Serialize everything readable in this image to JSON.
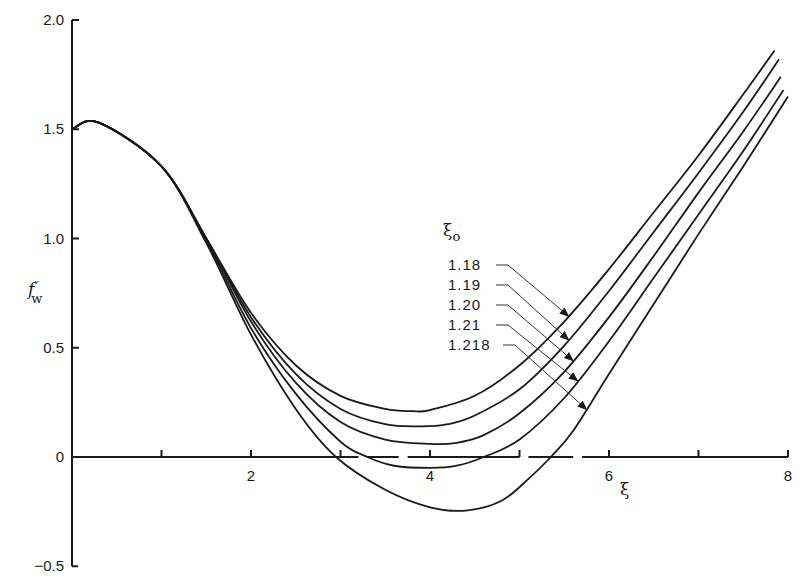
{
  "chart_data": {
    "type": "line",
    "title": "",
    "xlabel": "ξ",
    "ylabel": "f''_w",
    "xlim": [
      0,
      8
    ],
    "ylim": [
      -0.5,
      2.0
    ],
    "x_ticks": [
      2,
      4,
      6,
      8
    ],
    "x_minor_ticks": [
      1,
      3,
      5,
      7
    ],
    "y_ticks": [
      -0.5,
      0,
      0.5,
      1.0,
      1.5,
      2.0
    ],
    "y_tick_labels": [
      "−0.5",
      "0",
      "0.5",
      "1.0",
      "1.5",
      "2.0"
    ],
    "x_tick_labels": [
      "2",
      "4",
      "6",
      "8"
    ],
    "grid": false,
    "legend": {
      "title": "ξ",
      "title_subscript": "o",
      "position": "inside, center-right, with leader arrows to curves",
      "entries": [
        "1.18",
        "1.19",
        "1.20",
        "1.21",
        "1.218"
      ]
    },
    "series": [
      {
        "name": "1.18",
        "x": [
          0,
          0.3,
          1.0,
          1.5,
          2.0,
          2.5,
          3.0,
          3.5,
          3.8,
          4.0,
          4.5,
          5.0,
          5.5,
          6.0,
          6.5,
          7.0,
          7.5,
          7.85
        ],
        "y": [
          1.5,
          1.53,
          1.33,
          1.0,
          0.66,
          0.42,
          0.28,
          0.22,
          0.21,
          0.215,
          0.28,
          0.42,
          0.62,
          0.86,
          1.12,
          1.38,
          1.66,
          1.86
        ]
      },
      {
        "name": "1.19",
        "x": [
          0,
          0.3,
          1.0,
          1.5,
          2.0,
          2.5,
          3.0,
          3.5,
          3.9,
          4.2,
          4.5,
          5.0,
          5.5,
          6.0,
          6.5,
          7.0,
          7.5,
          7.9
        ],
        "y": [
          1.5,
          1.53,
          1.33,
          1.0,
          0.64,
          0.38,
          0.22,
          0.15,
          0.14,
          0.15,
          0.19,
          0.31,
          0.51,
          0.76,
          1.03,
          1.3,
          1.58,
          1.82
        ]
      },
      {
        "name": "1.20",
        "x": [
          0,
          0.3,
          1.0,
          1.5,
          2.0,
          2.5,
          3.0,
          3.5,
          4.0,
          4.3,
          4.6,
          5.0,
          5.5,
          6.0,
          6.5,
          7.0,
          7.5,
          7.92
        ],
        "y": [
          1.5,
          1.53,
          1.33,
          1.0,
          0.62,
          0.34,
          0.16,
          0.08,
          0.06,
          0.065,
          0.1,
          0.2,
          0.39,
          0.64,
          0.92,
          1.21,
          1.49,
          1.74
        ]
      },
      {
        "name": "1.21",
        "x": [
          0,
          0.3,
          1.0,
          1.5,
          2.0,
          2.5,
          3.0,
          3.3,
          3.6,
          4.0,
          4.3,
          4.6,
          5.0,
          5.5,
          6.0,
          6.5,
          7.0,
          7.5,
          7.95
        ],
        "y": [
          1.5,
          1.53,
          1.33,
          0.99,
          0.59,
          0.29,
          0.07,
          0.0,
          -0.04,
          -0.05,
          -0.04,
          0.0,
          0.08,
          0.27,
          0.53,
          0.82,
          1.11,
          1.4,
          1.68
        ]
      },
      {
        "name": "1.218",
        "x": [
          0,
          0.3,
          1.0,
          1.5,
          2.0,
          2.5,
          2.95,
          3.5,
          4.0,
          4.4,
          4.8,
          5.1,
          5.35,
          5.6,
          6.0,
          6.5,
          7.0,
          7.5,
          8.0
        ],
        "y": [
          1.5,
          1.53,
          1.33,
          0.98,
          0.56,
          0.22,
          0.0,
          -0.15,
          -0.23,
          -0.245,
          -0.2,
          -0.1,
          0.0,
          0.12,
          0.38,
          0.7,
          1.02,
          1.33,
          1.65
        ]
      }
    ]
  },
  "labels": {
    "y_axis": "f",
    "y_axis_primes": "′′",
    "y_axis_sub": "w",
    "x_axis": "ξ",
    "legend_title": "ξ",
    "legend_title_sub": "o"
  }
}
